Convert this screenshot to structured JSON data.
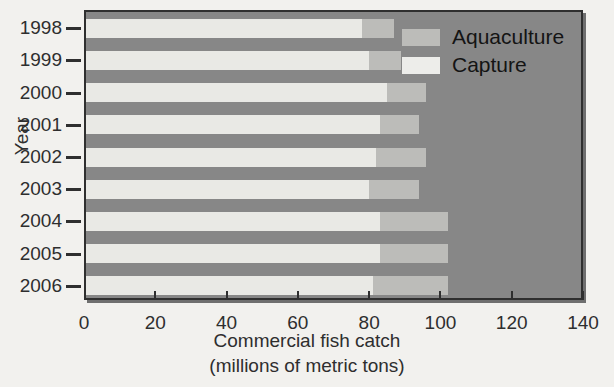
{
  "chart_data": {
    "type": "bar",
    "orientation": "horizontal",
    "stacked": true,
    "title": "",
    "xlabel": "Commercial fish catch",
    "xlabel_line2": "(millions of metric tons)",
    "ylabel": "Year",
    "categories": [
      "1998",
      "1999",
      "2000",
      "2001",
      "2002",
      "2003",
      "2004",
      "2005",
      "2006"
    ],
    "series": [
      {
        "name": "Capture",
        "color": "#ededea",
        "values": [
          78,
          80,
          85,
          83,
          82,
          80,
          83,
          83,
          81
        ]
      },
      {
        "name": "Aquaculture",
        "color": "#bcbcb9",
        "values": [
          9,
          9,
          11,
          11,
          14,
          14,
          19,
          19,
          21
        ]
      }
    ],
    "totals": [
      87,
      89,
      96,
      94,
      96,
      94,
      102,
      102,
      102
    ],
    "xlim": [
      0,
      140
    ],
    "xticks": [
      0,
      20,
      40,
      60,
      80,
      100,
      120,
      140
    ],
    "xtick_labels": [
      "0",
      "20",
      "40",
      "60",
      "80",
      "100",
      "120",
      "140"
    ],
    "grid": false,
    "legend_position": "top-right",
    "plot_background": "#878787"
  },
  "legend": {
    "items": [
      {
        "label": "Aquaculture",
        "swatch": "aqua"
      },
      {
        "label": "Capture",
        "swatch": "capture"
      }
    ]
  }
}
